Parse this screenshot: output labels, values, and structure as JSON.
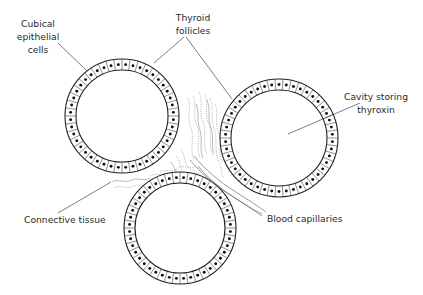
{
  "diagram": {
    "title": "Thyroid follicles",
    "labels": {
      "cubical": [
        "Cubical",
        "epithelial",
        "cells"
      ],
      "thyroid": [
        "Thyroid",
        "follicles"
      ],
      "cavity": [
        "Cavity storing",
        "thyroxin"
      ],
      "connective": "Connective tissue",
      "capillaries": "Blood capillaries"
    },
    "follicles": [
      {
        "name": "follicle-top-left",
        "cx": 122,
        "cy": 116,
        "outer_r": 57,
        "inner_r": 46,
        "cells": 44
      },
      {
        "name": "follicle-right",
        "cx": 279,
        "cy": 138,
        "outer_r": 59,
        "inner_r": 48,
        "cells": 46
      },
      {
        "name": "follicle-bottom",
        "cx": 180,
        "cy": 228,
        "outer_r": 56,
        "inner_r": 45,
        "cells": 44
      }
    ],
    "colors": {
      "line": "#222222",
      "text": "#2b2b2b",
      "tissue": "#777777",
      "background": "#ffffff"
    }
  }
}
